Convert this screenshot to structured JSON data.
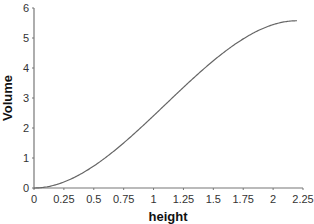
{
  "chart_data": {
    "type": "line",
    "title": "",
    "xlabel": "height",
    "ylabel": "Volume",
    "xlim": [
      0,
      2.25
    ],
    "ylim": [
      0,
      6
    ],
    "grid": false,
    "legend": null,
    "x_ticks": [
      "0",
      "0.25",
      "0.5",
      "0.75",
      "1",
      "1.25",
      "1.5",
      "1.75",
      "2",
      "2.25"
    ],
    "y_ticks": [
      "0",
      "1",
      "2",
      "3",
      "4",
      "5",
      "6"
    ],
    "series": [
      {
        "name": "Volume",
        "color": "#666666",
        "x": [
          0,
          0.1,
          0.2,
          0.3,
          0.4,
          0.5,
          0.6,
          0.7,
          0.8,
          0.9,
          1.0,
          1.1,
          1.2,
          1.3,
          1.4,
          1.5,
          1.6,
          1.7,
          1.8,
          1.9,
          2.0,
          2.1,
          2.2
        ],
        "values": [
          0,
          0.03,
          0.13,
          0.28,
          0.49,
          0.73,
          1.02,
          1.34,
          1.68,
          2.04,
          2.41,
          2.79,
          3.17,
          3.54,
          3.9,
          4.24,
          4.56,
          4.85,
          5.09,
          5.3,
          5.45,
          5.54,
          5.57
        ]
      }
    ]
  }
}
